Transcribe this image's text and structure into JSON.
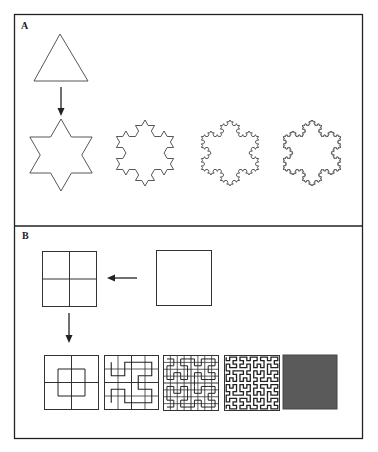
{
  "figure": {
    "panels": [
      {
        "id": "A",
        "label": "A",
        "title": "Koch snowflake construction",
        "items": [
          {
            "name": "initiator-triangle",
            "iteration": 0
          },
          {
            "name": "koch-iteration-1",
            "iteration": 1
          },
          {
            "name": "koch-iteration-2",
            "iteration": 2
          },
          {
            "name": "koch-iteration-3",
            "iteration": 3
          },
          {
            "name": "koch-iteration-4",
            "iteration": 4
          }
        ],
        "arrows": [
          {
            "from": "initiator-triangle",
            "to": "koch-iteration-1",
            "direction": "down"
          }
        ]
      },
      {
        "id": "B",
        "label": "B",
        "title": "Hilbert curve construction",
        "items": [
          {
            "name": "initiator-square",
            "grid": 1
          },
          {
            "name": "subdivided-square",
            "grid": 2
          },
          {
            "name": "hilbert-order-1",
            "grid": 2,
            "order": 1
          },
          {
            "name": "hilbert-order-2",
            "grid": 4,
            "order": 2
          },
          {
            "name": "hilbert-order-3",
            "grid": 8,
            "order": 3
          },
          {
            "name": "hilbert-order-5",
            "grid": 0,
            "order": 5
          },
          {
            "name": "filled-square",
            "fill": "#5a5a5a"
          }
        ],
        "arrows": [
          {
            "from": "initiator-square",
            "to": "subdivided-square",
            "direction": "left"
          },
          {
            "from": "subdivided-square",
            "to": "hilbert-order-1",
            "direction": "down"
          }
        ]
      }
    ],
    "colors": {
      "stroke": "#333333",
      "frame": "#222222",
      "fill": "#5a5a5a",
      "grid": "#444444"
    }
  }
}
